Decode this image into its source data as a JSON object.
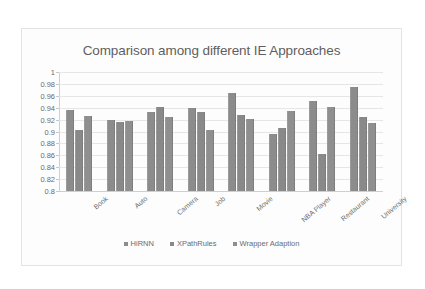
{
  "chart_data": {
    "type": "bar",
    "title": "Comparison among different IE Approaches",
    "xlabel": "",
    "ylabel": "",
    "ylim": [
      0.8,
      1.0
    ],
    "yticks": [
      "1",
      "0.98",
      "0.96",
      "0.94",
      "0.92",
      "0.9",
      "0.88",
      "0.86",
      "0.84",
      "0.82",
      "0.8"
    ],
    "ytick_values": [
      1,
      0.98,
      0.96,
      0.94,
      0.92,
      0.9,
      0.88,
      0.86,
      0.84,
      0.82,
      0.8
    ],
    "grid": true,
    "legend_position": "bottom",
    "categories": [
      "Book",
      "Auto",
      "Camera",
      "Job",
      "Movie",
      "NBA Player",
      "Restaurant",
      "University"
    ],
    "series": [
      {
        "name": "HiRNN",
        "values": [
          0.936,
          0.92,
          0.933,
          0.94,
          0.964,
          0.895,
          0.951,
          0.975
        ]
      },
      {
        "name": "XPathRules",
        "values": [
          0.902,
          0.916,
          0.941,
          0.932,
          0.927,
          0.906,
          0.862,
          0.924
        ]
      },
      {
        "name": "Wrapper Adaption",
        "values": [
          0.926,
          0.917,
          0.925,
          0.902,
          0.921,
          0.934,
          0.942,
          0.915
        ]
      }
    ],
    "series_colors": [
      "#8c8c8c",
      "#898989",
      "#8f8f8f"
    ]
  },
  "legend": {
    "items": [
      {
        "label": "HiRNN"
      },
      {
        "label": "XPathRules"
      },
      {
        "label": "Wrapper Adaption"
      }
    ]
  }
}
